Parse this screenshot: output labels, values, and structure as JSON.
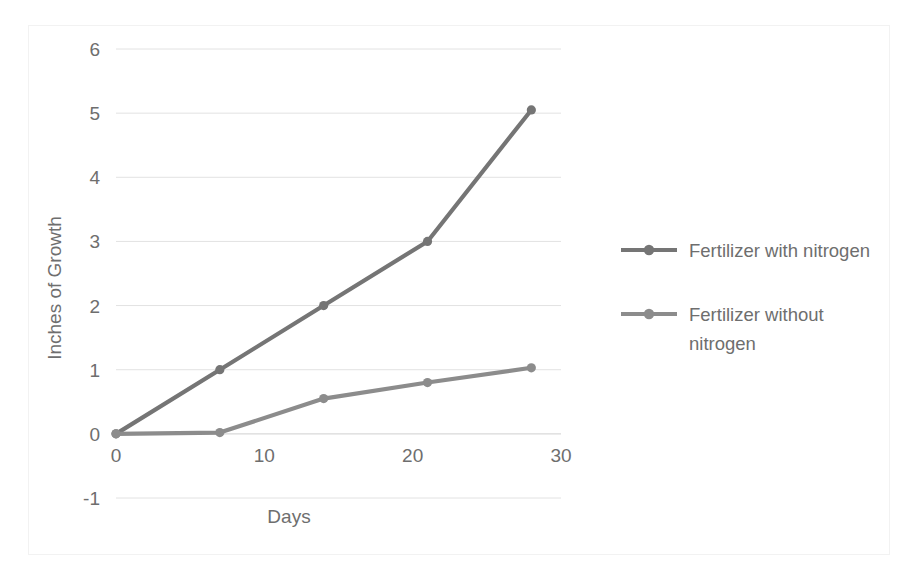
{
  "chart_data": {
    "type": "line",
    "title": "",
    "xlabel": "Days",
    "ylabel": "Inches of Growth",
    "x": [
      0,
      7,
      14,
      21,
      28
    ],
    "xlim": [
      0,
      30
    ],
    "ylim": [
      -1,
      6
    ],
    "xticks": [
      "0",
      "10",
      "20",
      "30"
    ],
    "xtick_values": [
      0,
      10,
      20,
      30
    ],
    "yticks": [
      "-1",
      "0",
      "1",
      "2",
      "3",
      "4",
      "5",
      "6"
    ],
    "ytick_values": [
      -1,
      0,
      1,
      2,
      3,
      4,
      5,
      6
    ],
    "grid": true,
    "legend_position": "right",
    "series": [
      {
        "name": "Fertilizer with nitrogen",
        "color": "#757575",
        "values": [
          0,
          1.0,
          2.0,
          3.0,
          5.05
        ]
      },
      {
        "name": "Fertilizer without nitrogen",
        "color": "#8c8c8c",
        "values": [
          0,
          0.02,
          0.55,
          0.8,
          1.03
        ]
      }
    ]
  },
  "legend": {
    "entries": [
      {
        "label": "Fertilizer with nitrogen",
        "color": "#757575"
      },
      {
        "label_line1": "Fertilizer without",
        "label_line2": "nitrogen",
        "color": "#8c8c8c"
      }
    ]
  },
  "colors": {
    "series_1": "#757575",
    "series_2": "#8c8c8c",
    "gridline": "#e2e2e2",
    "text": "#6e6e6e",
    "frame_border": "#f2f2f2",
    "background": "#ffffff"
  }
}
